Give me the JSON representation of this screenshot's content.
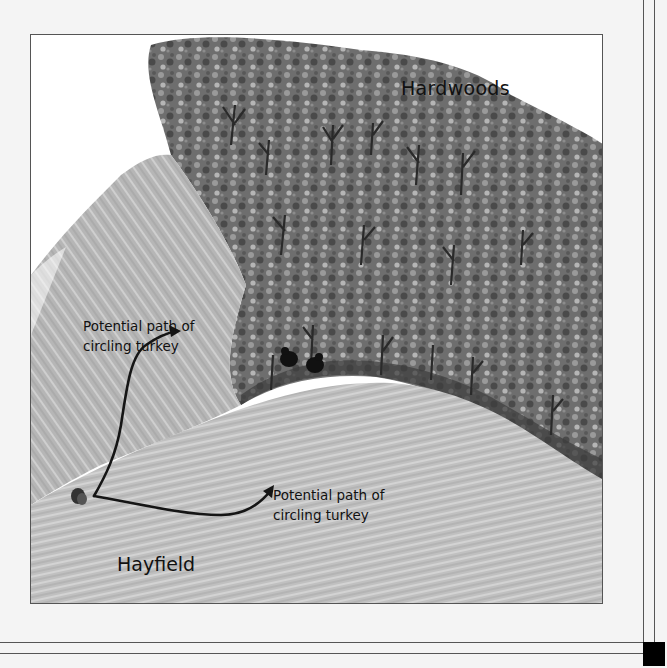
{
  "figure": {
    "labels": {
      "hardwoods": "Hardwoods",
      "path_upper": "Potential path of\ncircling turkey",
      "path_lower": "Potential path of\ncircling turkey",
      "hayfield": "Hayfield"
    },
    "elements": {
      "turkey": "turkey-icon",
      "hunters": "hunters-icon",
      "arrow_up": "arrow-icon",
      "arrow_right": "arrow-icon"
    },
    "colors": {
      "field": "#b8b8b8",
      "trees_dark": "#3a3a3a",
      "trees_mid": "#7a7a7a",
      "frame_line": "#555555",
      "page_bg": "#f4f4f4",
      "ink": "#111111"
    }
  }
}
